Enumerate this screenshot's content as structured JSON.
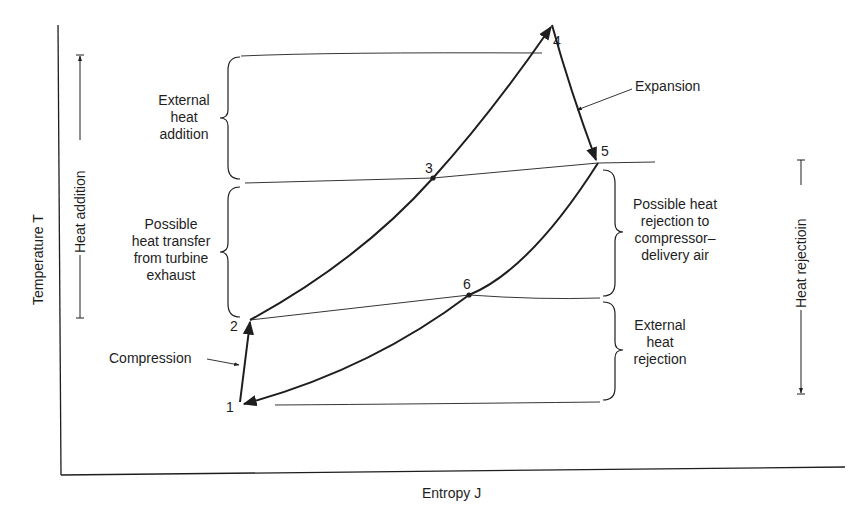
{
  "diagram": {
    "axes": {
      "y_label": "Temperature T",
      "x_label": "Entropy J"
    },
    "side_arrows": {
      "left": "Heat addition",
      "right": "Heat rejectioin"
    },
    "points": [
      {
        "id": "1",
        "label": "1"
      },
      {
        "id": "2",
        "label": "2"
      },
      {
        "id": "3",
        "label": "3"
      },
      {
        "id": "4",
        "label": "4"
      },
      {
        "id": "5",
        "label": "5"
      },
      {
        "id": "6",
        "label": "6"
      }
    ],
    "process_labels": {
      "compression": "Compression",
      "expansion": "Expansion"
    },
    "brace_labels": {
      "external_heat_addition": [
        "External",
        "heat",
        "addition"
      ],
      "possible_heat_transfer": [
        "Possible",
        "heat transfer",
        "from turbine",
        "exhaust"
      ],
      "possible_heat_rejection": [
        "Possible heat",
        "rejection to",
        "compressor–",
        "delivery air"
      ],
      "external_heat_rejection": [
        "External",
        "heat",
        "rejection"
      ]
    },
    "colors": {
      "ink": "#1e1e1e",
      "background": "#ffffff"
    }
  }
}
